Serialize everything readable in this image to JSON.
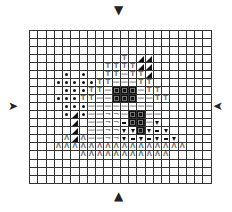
{
  "grid": {
    "columns": 22,
    "rows": 19,
    "legend": {
      ".": "empty",
      "D": "dot",
      "T": "tee",
      "-": "dash",
      "S": "filled-square",
      "R": "corner",
      "W": "thick-dash",
      "V": "down-triangle",
      "A": "caret",
      "K": "black-corner-triangle"
    },
    "cells": [
      "......................",
      "......................",
      "......................",
      "...........T.KK.......",
      ".........TTTTKK.......",
      "....D.D..TT-TTK.......",
      "...DDDDDTT---TT.......",
      "....DDDTT-SSS-TT......",
      "...DDDTT--SSS--TT.....",
      "....DDD--------.......",
      "....DKD--RR-SS--......",
      ".....K.--RRWSS-V......",
      ".....K.--RRVVSVWV.....",
      "....AKA--RRVWVWVWV....",
      "...AAAAAAAAAAAAAAAA...",
      "......AAAAAAAAAAA.....",
      "......................",
      "......................",
      "......................"
    ]
  },
  "glyphs": {
    "tee": "T",
    "dash": "—",
    "corner": "¬",
    "caret": "Λ"
  },
  "arrows": {
    "top": "▼",
    "bottom": "▲",
    "left": "➤",
    "right": "➤"
  },
  "colors": {
    "grid_line": "#333333",
    "symbol_dark": "#111111",
    "symbol_gray": "#777777"
  }
}
